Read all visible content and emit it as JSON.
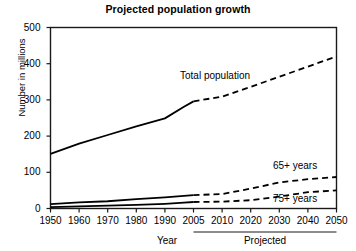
{
  "chart_data": {
    "type": "line",
    "title": "Projected population growth",
    "xlabel": "Year",
    "ylabel": "Number in millions",
    "xlim": [
      1950,
      2050
    ],
    "ylim": [
      0,
      500
    ],
    "grid": false,
    "legend_position": "inline-annotations",
    "x_tick_labels": [
      "1950",
      "1960",
      "1970",
      "1980",
      "1990",
      "2005",
      "2010",
      "2020",
      "2030",
      "2040",
      "2050"
    ],
    "x_tick_values": [
      1950,
      1960,
      1970,
      1980,
      1990,
      2005,
      2010,
      2020,
      2030,
      2040,
      2050
    ],
    "y_tick_labels": [
      "0",
      "100",
      "200",
      "300",
      "400",
      "500"
    ],
    "y_tick_values": [
      0,
      100,
      200,
      300,
      400,
      500
    ],
    "projection_start_year": 2005,
    "projection_caption": "Projected",
    "series": [
      {
        "name": "Total population",
        "x": [
          1950,
          1960,
          1970,
          1980,
          1990,
          2000,
          2005,
          2010,
          2020,
          2030,
          2040,
          2050
        ],
        "values": [
          151,
          179,
          203,
          227,
          249,
          281,
          296,
          309,
          336,
          364,
          392,
          420
        ],
        "solid_through": 2005,
        "style_solid": "solid",
        "style_projected": "dashed"
      },
      {
        "name": "65+ years",
        "x": [
          1950,
          1960,
          1970,
          1980,
          1990,
          2000,
          2005,
          2010,
          2020,
          2030,
          2040,
          2050
        ],
        "values": [
          12,
          17,
          20,
          26,
          31,
          35,
          37,
          40,
          55,
          72,
          81,
          87
        ],
        "solid_through": 2005,
        "style_solid": "solid",
        "style_projected": "dashed"
      },
      {
        "name": "75+ years",
        "x": [
          1950,
          1960,
          1970,
          1980,
          1990,
          2000,
          2005,
          2010,
          2020,
          2030,
          2040,
          2050
        ],
        "values": [
          4,
          6,
          8,
          10,
          13,
          16,
          18,
          19,
          23,
          33,
          45,
          50
        ],
        "solid_through": 2005,
        "style_solid": "solid",
        "style_projected": "dashed"
      }
    ],
    "annotations": [
      {
        "text": "Total population",
        "series": "Total population"
      },
      {
        "text": "65+ years",
        "series": "65+ years"
      },
      {
        "text": "75+ years",
        "series": "75+ years"
      }
    ],
    "colors": {
      "line": "#000000",
      "axis": "#000000",
      "background": "#ffffff"
    }
  }
}
